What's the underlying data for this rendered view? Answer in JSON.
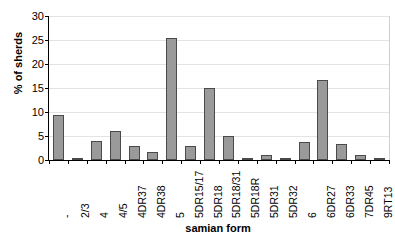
{
  "chart_data": {
    "type": "bar",
    "title": "",
    "xlabel": "samian form",
    "ylabel": "% of sherds",
    "ylim": [
      0,
      30
    ],
    "ytick_step": 5,
    "yticks": [
      0,
      5,
      10,
      15,
      20,
      25,
      30
    ],
    "grid": true,
    "legend": false,
    "categories": [
      "-",
      "2/3",
      "4",
      "4/5",
      "4DR37",
      "4DR38",
      "5",
      "5DR15/17",
      "5DR18",
      "5DR18/31",
      "5DR18R",
      "5DR31",
      "5DR32",
      "6",
      "6DR27",
      "6DR33",
      "7DR45",
      "9RT13"
    ],
    "values": [
      9.3,
      0.5,
      3.9,
      6.1,
      2.9,
      1.7,
      25.4,
      2.9,
      15.1,
      5.1,
      0.4,
      1.0,
      0.4,
      3.8,
      16.7,
      3.4,
      1.0,
      0.4
    ],
    "bar_color": "#9a9a9a",
    "bar_border_color": "#4a4a4a",
    "axis_color": "#000000",
    "gridline_color": "#e3e3e3",
    "background_color": "#ffffff"
  }
}
